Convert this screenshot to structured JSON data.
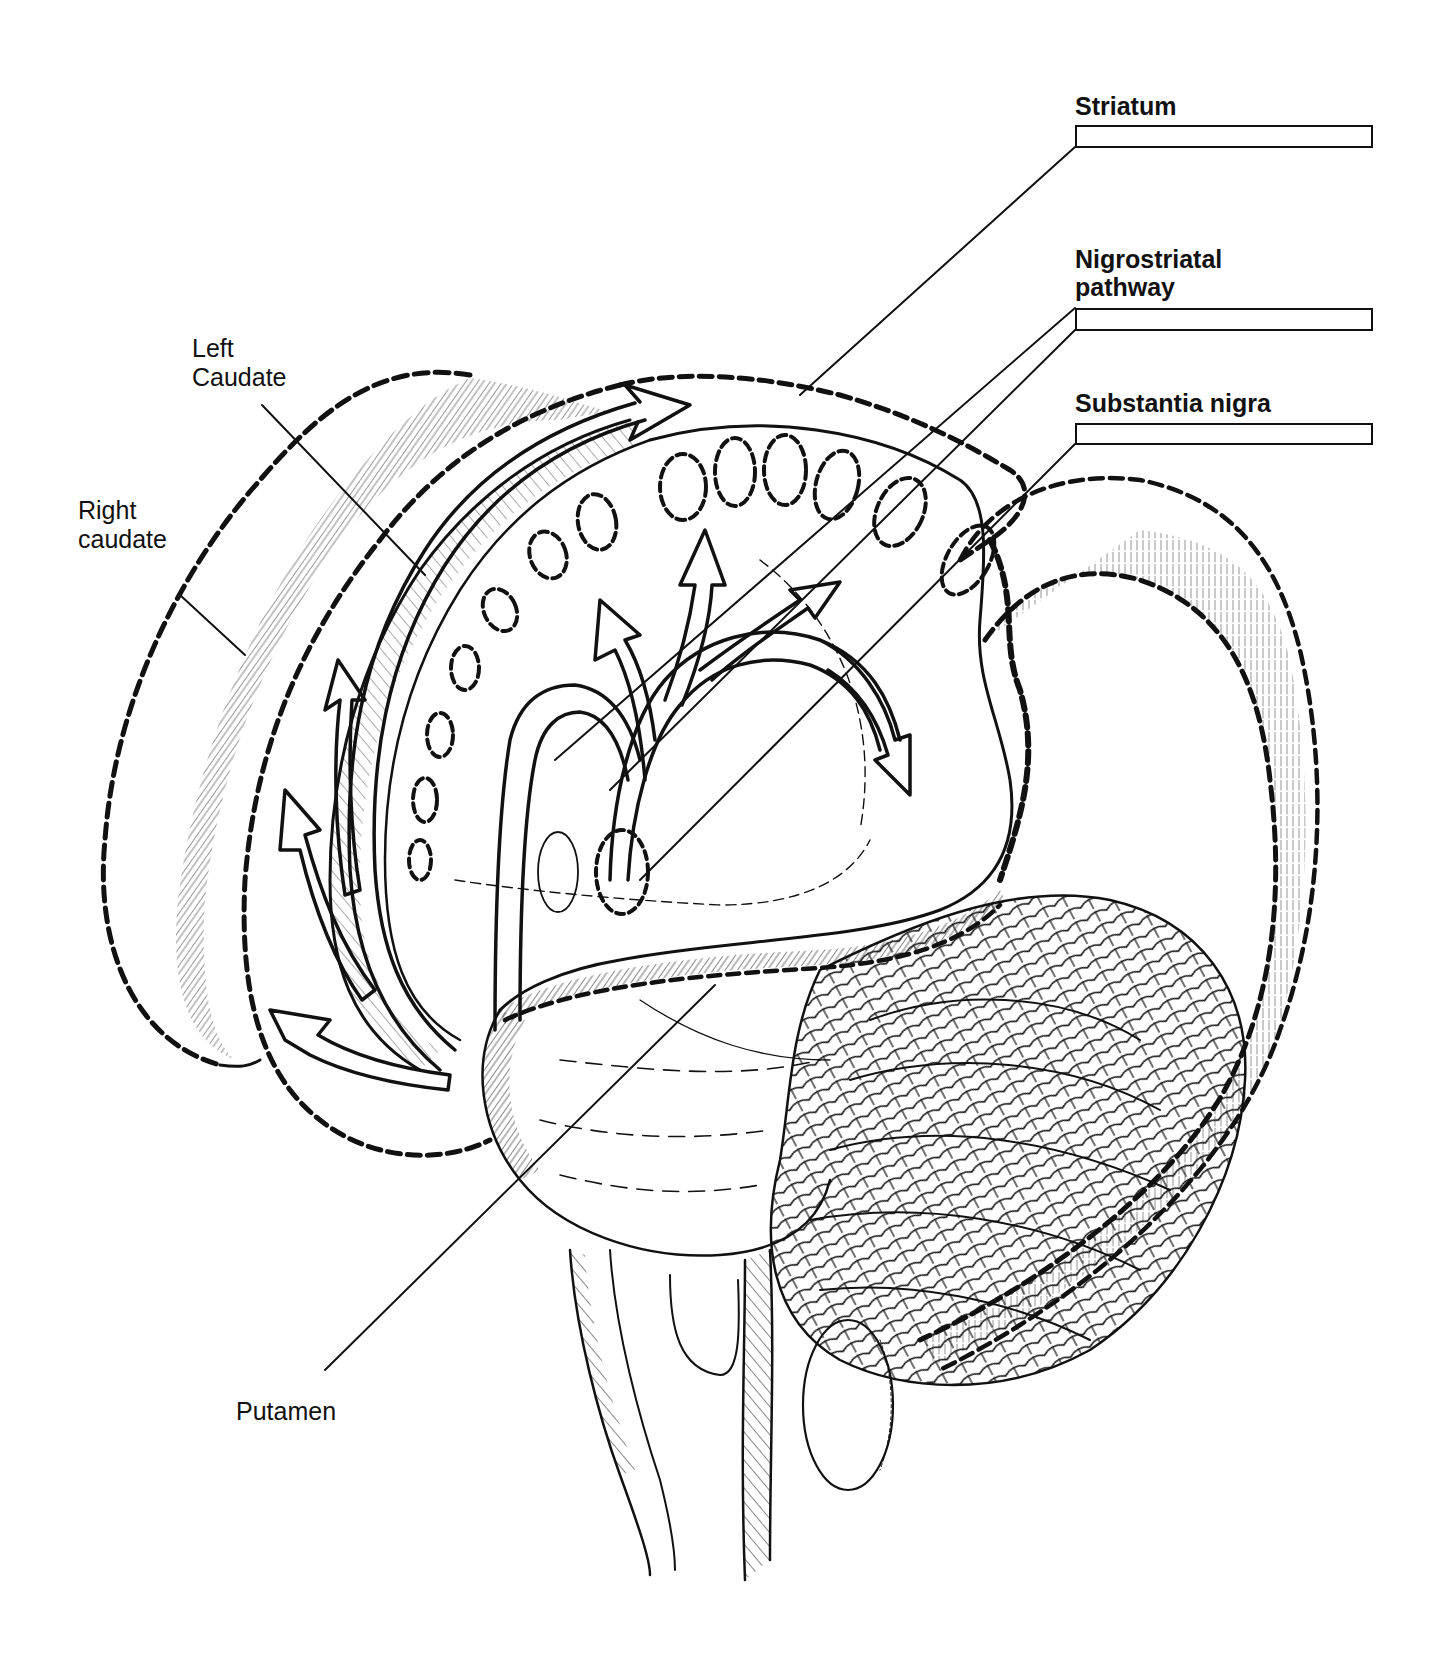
{
  "diagram": {
    "style": "black-and-white anatomical line drawing",
    "ink_color": "#111111",
    "background_color": "#ffffff"
  },
  "labels_right": [
    {
      "id": "striatum",
      "text": "Striatum",
      "has_answer_box": true
    },
    {
      "id": "nigrostriatal",
      "text_line1": "Nigrostriatal",
      "text_line2": "pathway",
      "has_answer_box": true
    },
    {
      "id": "substantia_nigra",
      "text": "Substantia nigra",
      "has_answer_box": true
    }
  ],
  "labels_left": [
    {
      "id": "left_caudate",
      "text_line1": "Left",
      "text_line2": "Caudate"
    },
    {
      "id": "right_caudate",
      "text_line1": "Right",
      "text_line2": "caudate"
    },
    {
      "id": "putamen",
      "text": "Putamen"
    }
  ],
  "answer_boxes": [
    {
      "for": "Striatum",
      "value": ""
    },
    {
      "for": "Nigrostriatal pathway",
      "value": ""
    },
    {
      "for": "Substantia nigra",
      "value": ""
    }
  ],
  "structures": [
    "Right caudate",
    "Left caudate",
    "Striatum",
    "Nigrostriatal pathway",
    "Substantia nigra",
    "Putamen",
    "Brainstem",
    "Cerebellum"
  ]
}
